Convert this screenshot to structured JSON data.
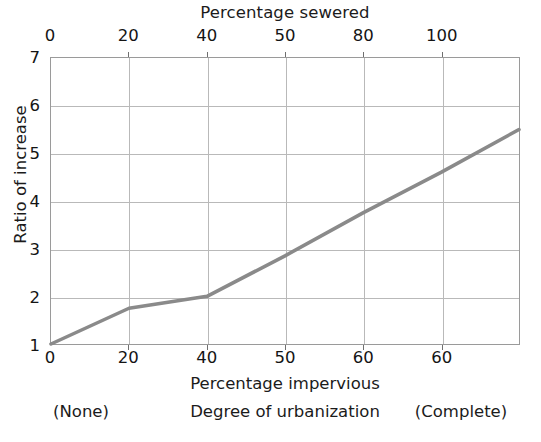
{
  "chart_data": {
    "type": "line",
    "title": "",
    "series": [
      {
        "name": "Ratio of increase in mean annual flood",
        "x": [
          0,
          60
        ],
        "y": [
          1.0,
          5.5
        ],
        "color": "#8a8a8a",
        "points": [
          {
            "x": 0,
            "y": 1.0
          },
          {
            "x": 10,
            "y": 1.75
          },
          {
            "x": 20,
            "y": 2.0
          },
          {
            "x": 30,
            "y": 2.85
          },
          {
            "x": 40,
            "y": 3.75
          },
          {
            "x": 50,
            "y": 4.6
          },
          {
            "x": 60,
            "y": 5.5
          }
        ]
      }
    ],
    "xlabel": "Percentage impervious",
    "ylabel": "Ratio of increase",
    "xlabel_top": "Percentage sewered",
    "xlim": [
      0,
      60
    ],
    "ylim": [
      1,
      7
    ],
    "xlim_top": [
      0,
      100
    ],
    "xticks_bottom": [
      "0",
      "20",
      "40",
      "50",
      "60",
      "60"
    ],
    "xticks_top": [
      "0",
      "20",
      "40",
      "50",
      "80",
      "100"
    ],
    "yticks": [
      "1",
      "2",
      "3",
      "4",
      "5",
      "6",
      "7"
    ],
    "grid": true,
    "legend": "none",
    "annotations": [
      "(None)",
      "Degree of urbanization",
      "(Complete)"
    ]
  },
  "axes": {
    "top_title": "Percentage sewered",
    "bottom_title": "Percentage impervious",
    "y_title": "Ratio of increase",
    "top_ticks": [
      {
        "label": "0",
        "pos": 0
      },
      {
        "label": "20",
        "pos": 16.6667
      },
      {
        "label": "40",
        "pos": 33.3333
      },
      {
        "label": "50",
        "pos": 50
      },
      {
        "label": "80",
        "pos": 66.6667
      },
      {
        "label": "100",
        "pos": 83.3333
      },
      {
        "label": "",
        "pos": 100
      }
    ],
    "bottom_ticks": [
      {
        "label": "0",
        "pos": 0
      },
      {
        "label": "20",
        "pos": 16.6667
      },
      {
        "label": "40",
        "pos": 33.3333
      },
      {
        "label": "50",
        "pos": 50
      },
      {
        "label": "60",
        "pos": 66.6667
      },
      {
        "label": "60",
        "pos": 83.3333
      },
      {
        "label": "",
        "pos": 100
      }
    ],
    "y_ticks": [
      {
        "label": "7",
        "pos": 0
      },
      {
        "label": "6",
        "pos": 16.6667
      },
      {
        "label": "5",
        "pos": 33.3333
      },
      {
        "label": "4",
        "pos": 50
      },
      {
        "label": "3",
        "pos": 66.6667
      },
      {
        "label": "2",
        "pos": 83.3333
      },
      {
        "label": "1",
        "pos": 100
      }
    ]
  },
  "captions": {
    "left": "(None)",
    "center": "Degree of urbanization",
    "right": "(Complete)"
  },
  "colors": {
    "line": "#8a8a8a",
    "grid": "#b9b9b9",
    "frame": "#9a9a9a",
    "text": "#141414",
    "background": "#ffffff"
  }
}
